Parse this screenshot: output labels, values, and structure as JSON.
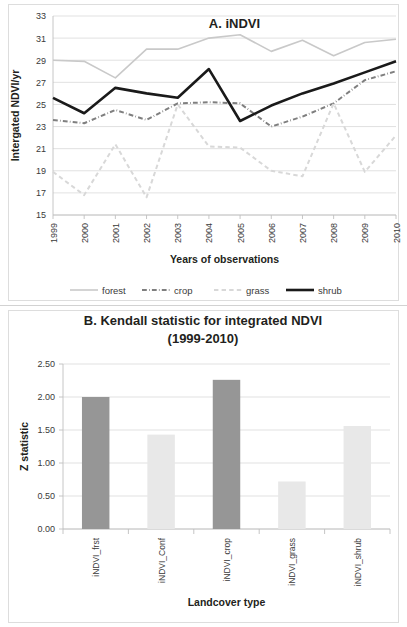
{
  "figure": {
    "background_color": "#ffffff",
    "border_color": "#dddddd"
  },
  "chart_data": [
    {
      "id": "panel-a",
      "type": "line",
      "title": "A. iNDVI",
      "xlabel": "Years of observations",
      "ylabel": "Intergated NDVI/yr",
      "x": [
        1999,
        2000,
        2001,
        2002,
        2003,
        2004,
        2005,
        2006,
        2007,
        2008,
        2009,
        2010
      ],
      "xtick_labels": [
        "1999",
        "2000",
        "2001",
        "2002",
        "2003",
        "2004",
        "2005",
        "2006",
        "2007",
        "2008",
        "2009",
        "2010"
      ],
      "ytick_labels": [
        "15",
        "17",
        "19",
        "21",
        "23",
        "25",
        "27",
        "29",
        "31",
        "33"
      ],
      "ylim": [
        15,
        33
      ],
      "ytick_step": 2,
      "grid": true,
      "legend_position": "bottom",
      "series": [
        {
          "name": "forest",
          "color": "#c9c9c9",
          "width": 1.6,
          "dash": "none",
          "values": [
            29.0,
            28.9,
            27.4,
            30.0,
            30.0,
            31.0,
            31.3,
            29.8,
            30.8,
            29.4,
            30.6,
            30.9
          ]
        },
        {
          "name": "crop",
          "color": "#7f7f7f",
          "width": 2.0,
          "dash": "dashdot",
          "values": [
            23.6,
            23.3,
            24.5,
            23.6,
            25.1,
            25.2,
            25.1,
            23.0,
            23.9,
            25.1,
            27.2,
            28.0
          ]
        },
        {
          "name": "grass",
          "color": "#d8d8d8",
          "width": 2.0,
          "dash": "dashed",
          "values": [
            18.9,
            16.8,
            21.4,
            16.6,
            25.0,
            21.2,
            21.1,
            19.0,
            18.5,
            25.1,
            18.9,
            22.2
          ]
        },
        {
          "name": "shrub",
          "color": "#1a1a1a",
          "width": 2.6,
          "dash": "none",
          "values": [
            25.6,
            24.2,
            26.5,
            26.0,
            25.6,
            28.2,
            23.5,
            24.9,
            26.0,
            26.9,
            27.9,
            28.9
          ]
        }
      ]
    },
    {
      "id": "panel-b",
      "type": "bar",
      "title_line1": "B. Kendall statistic for integrated NDVI",
      "title_line2": "(1999-2010)",
      "xlabel": "Landcover type",
      "ylabel": "Z statistic",
      "categories": [
        "iNDVI_frst",
        "iNDVI_Conf",
        "iNDVI_crop",
        "iNDVI_grass",
        "iNDVI_shrub"
      ],
      "values": [
        2.0,
        1.43,
        2.26,
        0.72,
        1.56
      ],
      "bar_colors": [
        "#969696",
        "#e8e8e8",
        "#969696",
        "#e8e8e8",
        "#e8e8e8"
      ],
      "ytick_labels": [
        "0.00",
        "0.50",
        "1.00",
        "1.50",
        "2.00",
        "2.50"
      ],
      "ylim": [
        0,
        2.5
      ],
      "ytick_step": 0.5,
      "grid": true,
      "legend_position": "none"
    }
  ]
}
